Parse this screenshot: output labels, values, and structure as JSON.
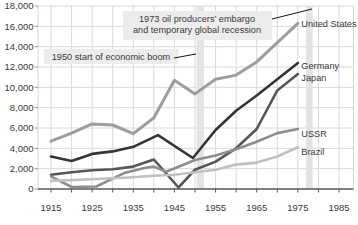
{
  "chart_data": {
    "type": "line",
    "title": "",
    "xlabel": "",
    "ylabel": "",
    "grid": true,
    "x_minor_step_years": 5,
    "x_axis": {
      "ticks": [
        {
          "year": 1915,
          "label": "1915"
        },
        {
          "year": 1925,
          "label": "1925"
        },
        {
          "year": 1935,
          "label": "1935"
        },
        {
          "year": 1945,
          "label": "1945"
        },
        {
          "year": 1955,
          "label": "1955"
        },
        {
          "year": 1965,
          "label": "1965"
        },
        {
          "year": 1975,
          "label": "1975"
        },
        {
          "year": 1985,
          "label": "1985"
        }
      ]
    },
    "y_axis": {
      "range": [
        0,
        18000
      ],
      "ticks": [
        {
          "value": 0,
          "label": "0"
        },
        {
          "value": 2000,
          "label": "2,000"
        },
        {
          "value": 4000,
          "label": "4,000"
        },
        {
          "value": 6000,
          "label": "6,000"
        },
        {
          "value": 8000,
          "label": "8,000"
        },
        {
          "value": 10000,
          "label": "10,000"
        },
        {
          "value": 12000,
          "label": "12,000"
        },
        {
          "value": 14000,
          "label": "14,000"
        },
        {
          "value": 16000,
          "label": "16,000"
        },
        {
          "value": 18000,
          "label": "18,000"
        }
      ]
    },
    "series": [
      {
        "name": "United States",
        "color": "#9d9d9d",
        "stroke_width": 3,
        "label_dy": 1.5,
        "points": [
          [
            1915,
            4700
          ],
          [
            1920,
            5500
          ],
          [
            1925,
            6400
          ],
          [
            1930,
            6300
          ],
          [
            1935,
            5450
          ],
          [
            1940,
            7000
          ],
          [
            1945,
            10700
          ],
          [
            1950,
            9350
          ],
          [
            1955,
            10800
          ],
          [
            1960,
            11200
          ],
          [
            1965,
            12500
          ],
          [
            1970,
            14400
          ],
          [
            1975,
            16300
          ]
        ]
      },
      {
        "name": "Germany",
        "color": "#343434",
        "stroke_width": 2.6,
        "label_dy": 4,
        "points": [
          [
            1915,
            3200
          ],
          [
            1920,
            2750
          ],
          [
            1925,
            3450
          ],
          [
            1930,
            3700
          ],
          [
            1935,
            4150
          ],
          [
            1941,
            5300
          ],
          [
            1949.5,
            3050
          ],
          [
            1955,
            5800
          ],
          [
            1960,
            7700
          ],
          [
            1965,
            9200
          ],
          [
            1970,
            10800
          ],
          [
            1975,
            12400
          ]
        ]
      },
      {
        "name": "Japan",
        "color": "#565658",
        "stroke_width": 2.6,
        "label_dy": 4,
        "points": [
          [
            1915,
            1400
          ],
          [
            1920,
            1650
          ],
          [
            1925,
            1850
          ],
          [
            1930,
            1950
          ],
          [
            1935,
            2200
          ],
          [
            1940,
            2900
          ],
          [
            1946,
            150
          ],
          [
            1950,
            1900
          ],
          [
            1955,
            2700
          ],
          [
            1960,
            4000
          ],
          [
            1965,
            5900
          ],
          [
            1970,
            9700
          ],
          [
            1975,
            11300
          ]
        ]
      },
      {
        "name": "USSR",
        "color": "#8e8e8e",
        "stroke_width": 2.6,
        "label_dy": 5,
        "points": [
          [
            1915,
            1250
          ],
          [
            1920,
            200
          ],
          [
            1926,
            250
          ],
          [
            1933,
            1600
          ],
          [
            1938,
            2100
          ],
          [
            1940,
            2200
          ],
          [
            1943,
            1700
          ],
          [
            1950,
            2850
          ],
          [
            1955,
            3300
          ],
          [
            1960,
            3900
          ],
          [
            1965,
            4650
          ],
          [
            1970,
            5500
          ],
          [
            1975,
            5900
          ]
        ]
      },
      {
        "name": "Brazil",
        "color": "#c0c0c0",
        "stroke_width": 2.6,
        "label_dy": 5,
        "points": [
          [
            1915,
            800
          ],
          [
            1920,
            880
          ],
          [
            1925,
            960
          ],
          [
            1930,
            1060
          ],
          [
            1935,
            1160
          ],
          [
            1940,
            1300
          ],
          [
            1945,
            1400
          ],
          [
            1950,
            1650
          ],
          [
            1955,
            1900
          ],
          [
            1960,
            2400
          ],
          [
            1965,
            2600
          ],
          [
            1970,
            3200
          ],
          [
            1975,
            4100
          ]
        ]
      }
    ],
    "bands": [
      {
        "name": "boom-1950-band",
        "from_year": 1950.4,
        "to_year": 1952.2
      },
      {
        "name": "embargo-1973-band",
        "from_year": 1977.0,
        "to_year": 1978.6
      }
    ],
    "annotations": [
      {
        "name": "embargo-1973",
        "lines": [
          "1973 oil producers’ embargo",
          "and temporary global recession"
        ],
        "box_px": {
          "x": 123,
          "y": 11,
          "w": 149,
          "h": 29
        },
        "text_px": {
          "x": 197,
          "y": [
            21.5,
            33
          ]
        },
        "leader_px": [
          [
            272,
            19
          ],
          [
            312,
            9
          ]
        ]
      },
      {
        "name": "boom-1950",
        "lines": [
          "1950 start of economic boom"
        ],
        "box_px": {
          "x": 44,
          "y": 49,
          "w": 134,
          "h": 15
        },
        "text_px": {
          "x": 111,
          "y": [
            60
          ]
        },
        "leader_px": [
          [
            174,
            58
          ],
          [
            196,
            54
          ]
        ]
      }
    ],
    "colors": {
      "background": "#ffffff",
      "grid": "#d8d8d8",
      "band": "#e3e3e3",
      "axis": "#58595b",
      "y_tick": "#9a9a9a",
      "text": "#3a3a3a",
      "annotation_bg": "#ececec",
      "leader": "#141414"
    }
  }
}
